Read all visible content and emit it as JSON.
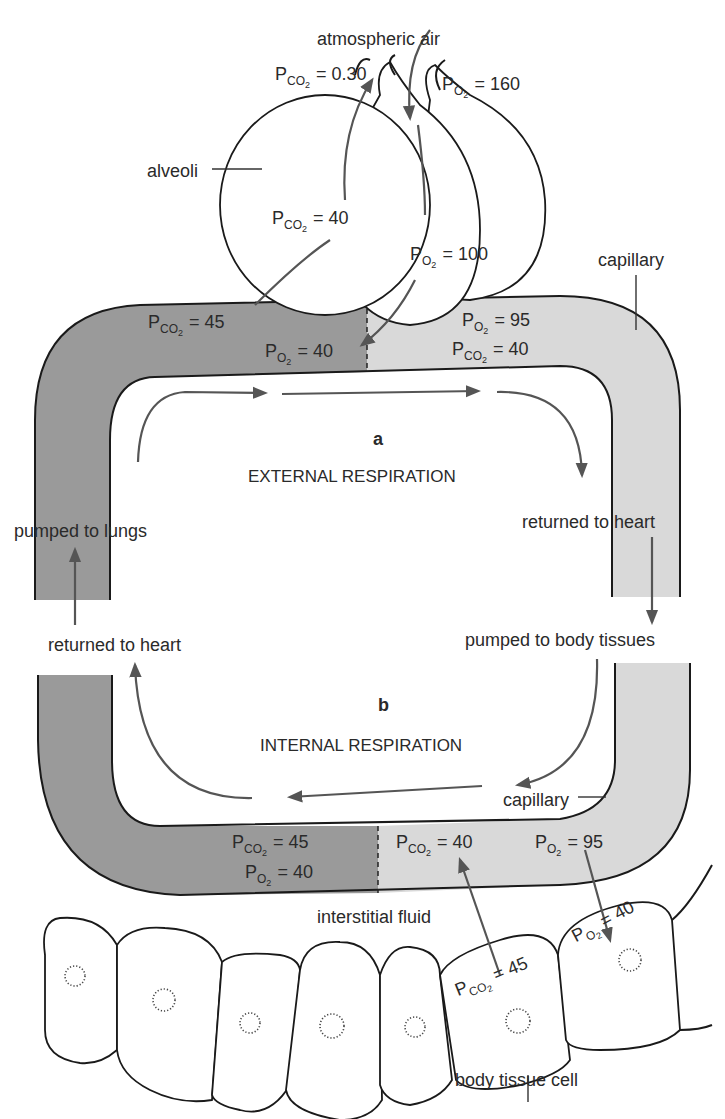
{
  "colors": {
    "deoxygenated_blood": "#9a9a9a",
    "oxygenated_blood": "#d9d9d9",
    "arrow": "#555555",
    "outline": "#1a1a1a",
    "text": "#2a2a2a"
  },
  "labels": {
    "atmospheric_air": "atmospheric air",
    "alveoli": "alveoli",
    "capillary_top": "capillary",
    "capillary_bottom": "capillary",
    "external_letter": "a",
    "external_title": "EXTERNAL RESPIRATION",
    "internal_letter": "b",
    "internal_title": "INTERNAL RESPIRATION",
    "pumped_to_lungs": "pumped to lungs",
    "returned_to_heart_left": "returned to heart",
    "returned_to_heart_right": "returned to heart",
    "pumped_to_body_tissues": "pumped to body tissues",
    "interstitial_fluid": "interstitial fluid",
    "body_tissue_cell": "body tissue cell"
  },
  "pressures": {
    "atm_pco2": {
      "gas": "P",
      "sub": "CO",
      "sub2": "2",
      "value": "= 0.30"
    },
    "atm_po2": {
      "gas": "P",
      "sub": "O",
      "sub2": "2",
      "value": "= 160"
    },
    "alveoli_pco2": {
      "gas": "P",
      "sub": "CO",
      "sub2": "2",
      "value": "= 40"
    },
    "alveoli_po2": {
      "gas": "P",
      "sub": "O",
      "sub2": "2",
      "value": "= 100"
    },
    "lung_cap_in_pco2": {
      "gas": "P",
      "sub": "CO",
      "sub2": "2",
      "value": "= 45"
    },
    "lung_cap_in_po2": {
      "gas": "P",
      "sub": "O",
      "sub2": "2",
      "value": "= 40"
    },
    "lung_cap_out_po2": {
      "gas": "P",
      "sub": "O",
      "sub2": "2",
      "value": "= 95"
    },
    "lung_cap_out_pco2": {
      "gas": "P",
      "sub": "CO",
      "sub2": "2",
      "value": "= 40"
    },
    "tissue_cap_out_pco2": {
      "gas": "P",
      "sub": "CO",
      "sub2": "2",
      "value": "= 45"
    },
    "tissue_cap_out_po2": {
      "gas": "P",
      "sub": "O",
      "sub2": "2",
      "value": "= 40"
    },
    "tissue_cap_in_pco2": {
      "gas": "P",
      "sub": "CO",
      "sub2": "2",
      "value": "= 40"
    },
    "tissue_cap_in_po2": {
      "gas": "P",
      "sub": "O",
      "sub2": "2",
      "value": "= 95"
    },
    "cell_pco2": {
      "gas": "P",
      "sub": "CO",
      "sub2": "2",
      "value": "= 45"
    },
    "cell_po2": {
      "gas": "P",
      "sub": "O",
      "sub2": "2",
      "value": "= 40"
    }
  }
}
